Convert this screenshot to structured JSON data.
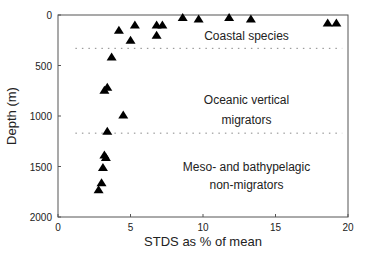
{
  "chart_data": {
    "type": "scatter",
    "title": "",
    "xlabel": "STDS as % of mean",
    "ylabel": "Depth (m)",
    "xlim": [
      0,
      20
    ],
    "ylim": [
      2000,
      0
    ],
    "y_inverted": true,
    "xticks": [
      0,
      5,
      10,
      15,
      20
    ],
    "yticks": [
      0,
      500,
      1000,
      1500,
      2000
    ],
    "grid": false,
    "marker": "triangle",
    "series": [
      {
        "name": "species",
        "points": [
          {
            "x": 4.2,
            "y": 150
          },
          {
            "x": 5.3,
            "y": 100
          },
          {
            "x": 5.0,
            "y": 250
          },
          {
            "x": 6.8,
            "y": 200
          },
          {
            "x": 6.8,
            "y": 100
          },
          {
            "x": 7.2,
            "y": 100
          },
          {
            "x": 8.6,
            "y": 25
          },
          {
            "x": 9.7,
            "y": 40
          },
          {
            "x": 11.8,
            "y": 25
          },
          {
            "x": 13.3,
            "y": 40
          },
          {
            "x": 18.6,
            "y": 80
          },
          {
            "x": 19.2,
            "y": 80
          },
          {
            "x": 3.7,
            "y": 415
          },
          {
            "x": 3.4,
            "y": 715
          },
          {
            "x": 3.2,
            "y": 745
          },
          {
            "x": 4.5,
            "y": 990
          },
          {
            "x": 3.4,
            "y": 1150
          },
          {
            "x": 3.2,
            "y": 1385
          },
          {
            "x": 3.3,
            "y": 1410
          },
          {
            "x": 3.1,
            "y": 1510
          },
          {
            "x": 3.0,
            "y": 1660
          },
          {
            "x": 2.8,
            "y": 1730
          }
        ]
      }
    ],
    "reference_lines": [
      {
        "orientation": "horizontal",
        "y": 330,
        "x_from": 1.2,
        "x_to": 19.6,
        "style": "dotted"
      },
      {
        "orientation": "horizontal",
        "y": 1170,
        "x_from": 1.2,
        "x_to": 19.6,
        "style": "dotted"
      }
    ],
    "annotations": [
      {
        "text": "Coastal species",
        "x": 13,
        "y": 210
      },
      {
        "text": "Oceanic vertical",
        "x": 13,
        "y": 840
      },
      {
        "text": "migrators",
        "x": 13,
        "y": 1040
      },
      {
        "text": "Meso- and bathypelagic",
        "x": 13,
        "y": 1500
      },
      {
        "text": "non-migrators",
        "x": 13,
        "y": 1680
      }
    ]
  }
}
